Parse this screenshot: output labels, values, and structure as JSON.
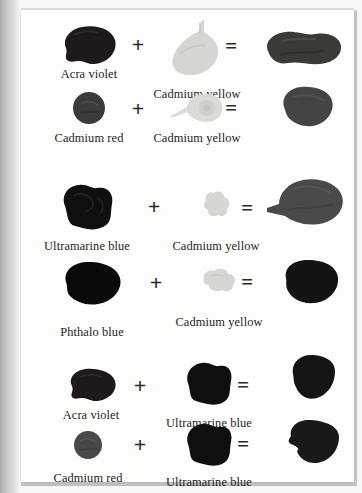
{
  "page": {
    "kind": "scanned-book-page",
    "background_color": "#b9bcbb",
    "paper_color": "#fdfdfc",
    "text_color": "#26241f"
  },
  "operators": {
    "plus": "+",
    "equals": "="
  },
  "swatch_colors": {
    "acra_violet": "#1d1a19",
    "cadmium_yellow": "#d3d3cf",
    "cadmium_red": "#3d3b3a",
    "ultramarine_blue": "#100f0f",
    "phthalo_blue": "#0a0a0a",
    "mix_violet_yellow": "#3b3a37",
    "mix_red_yellow": "#454443",
    "mix_ultramarine_yellow": "#4a4a48",
    "mix_phthalo_yellow": "#131312",
    "mix_violet_ultramarine": "#151414",
    "mix_red_ultramarine": "#1a1918"
  },
  "rows": [
    {
      "id": "acra-violet-plus-cadmium-yellow",
      "left": {
        "label": "Acra violet",
        "color_key": "acra_violet"
      },
      "right": {
        "label": "Cadmium yellow",
        "color_key": "cadmium_yellow"
      },
      "result": {
        "label": "",
        "color_key": "mix_violet_yellow"
      }
    },
    {
      "id": "cadmium-red-plus-cadmium-yellow",
      "left": {
        "label": "Cadmium red",
        "color_key": "cadmium_red"
      },
      "right": {
        "label": "Cadmium yellow",
        "color_key": "cadmium_yellow"
      },
      "result": {
        "label": "",
        "color_key": "mix_red_yellow"
      }
    },
    {
      "id": "ultramarine-blue-plus-cadmium-yellow",
      "left": {
        "label": "Ultramarine blue",
        "color_key": "ultramarine_blue"
      },
      "right": {
        "label": "Cadmium yellow",
        "color_key": "cadmium_yellow"
      },
      "result": {
        "label": "",
        "color_key": "mix_ultramarine_yellow"
      }
    },
    {
      "id": "phthalo-blue-plus-cadmium-yellow",
      "left": {
        "label": "Phthalo blue",
        "color_key": "phthalo_blue"
      },
      "right": {
        "label": "Cadmium yellow",
        "color_key": "cadmium_yellow"
      },
      "result": {
        "label": "",
        "color_key": "mix_phthalo_yellow"
      }
    },
    {
      "id": "acra-violet-plus-ultramarine-blue",
      "left": {
        "label": "Acra violet",
        "color_key": "acra_violet"
      },
      "right": {
        "label": "Ultramarine blue",
        "color_key": "ultramarine_blue"
      },
      "result": {
        "label": "",
        "color_key": "mix_violet_ultramarine"
      }
    },
    {
      "id": "cadmium-red-plus-ultramarine-blue",
      "left": {
        "label": "Cadmium red",
        "color_key": "cadmium_red"
      },
      "right": {
        "label": "Ultramarine blue",
        "color_key": "ultramarine_blue"
      },
      "result": {
        "label": "",
        "color_key": "mix_red_ultramarine"
      }
    }
  ]
}
